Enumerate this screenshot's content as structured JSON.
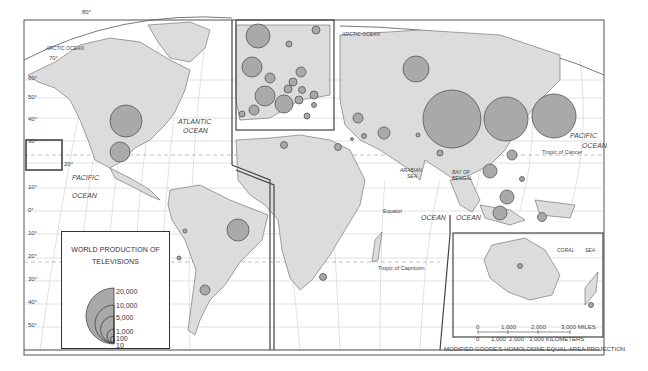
{
  "legend": {
    "title_line1": "WORLD PRODUCTION OF",
    "title_line2": "TELEVISIONS",
    "values": [
      "20,000",
      "10,000",
      "5,000",
      "1,000",
      "100",
      "10"
    ]
  },
  "labels": {
    "arctic_ocean_w": "ARCTIC OCEAN",
    "arctic_ocean_e": "ARCTIC OCEAN",
    "atlantic_1": "ATLANTIC",
    "atlantic_2": "OCEAN",
    "pacific_w_1": "PACIFIC",
    "pacific_w_2": "OCEAN",
    "pacific_e_1": "PACIFIC",
    "pacific_e_2": "OCEAN",
    "indian": "INDIAN",
    "indian_ocean": "OCEAN",
    "arabian_1": "ARABIAN",
    "arabian_2": "SEA",
    "bengal_1": "BAY OF",
    "bengal_2": "BENGAL",
    "coral_1": "CORAL",
    "coral_2": "SEA",
    "equator": "Equator",
    "tropic_cancer": "Tropic of Cancer",
    "tropic_capricorn": "Tropic of Capricorn"
  },
  "lat_labels_left": [
    "80°",
    "70°",
    "60°",
    "50°",
    "40°",
    "30°",
    "20°",
    "10°",
    "0°",
    "10°",
    "20°",
    "30°",
    "40°",
    "50°"
  ],
  "scale": {
    "miles": [
      "0",
      "1,000",
      "2,000",
      "3,000 MILES"
    ],
    "km": [
      "0",
      "1,000",
      "2,000",
      "3,000 KILOMETERS"
    ]
  },
  "projection": "MODIFIED GOODE'S HOMOLOSINE EQUAL-AREA PROJECTION",
  "colors": {
    "land": "#dcdcdc",
    "circle_fill": "#a9a9a9",
    "circle_stroke": "#555555",
    "grid": "#c8c8c8",
    "border": "#444444"
  }
}
